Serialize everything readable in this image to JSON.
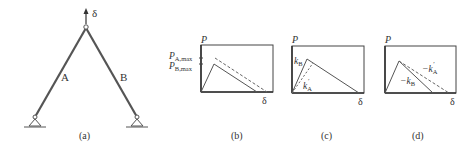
{
  "figure": {
    "panel_a": {
      "caption": "(a)",
      "load_label": "δ",
      "member_left": "A",
      "member_right": "B"
    },
    "panel_b": {
      "caption": "(b)",
      "y_axis": "P",
      "x_axis": "δ",
      "tick_upper": "P",
      "tick_upper_sub": "A,max",
      "tick_lower": "P",
      "tick_lower_sub": "B,max"
    },
    "panel_c": {
      "caption": "(c)",
      "y_axis": "P",
      "x_axis": "δ",
      "stiffness_B": "k",
      "stiffness_B_sub": "B",
      "stiffness_A": "k",
      "stiffness_A_sub": "A",
      "stiffness_A_prime": "′"
    },
    "panel_d": {
      "caption": "(d)",
      "y_axis": "P",
      "x_axis": "δ",
      "softening_A": "−k",
      "softening_A_sub": "A",
      "softening_A_prime": "′",
      "softening_B": "−k",
      "softening_B_sub": "B"
    }
  },
  "colors": {
    "line": "#555555",
    "frame": "#444444",
    "dashed": "#666666"
  }
}
